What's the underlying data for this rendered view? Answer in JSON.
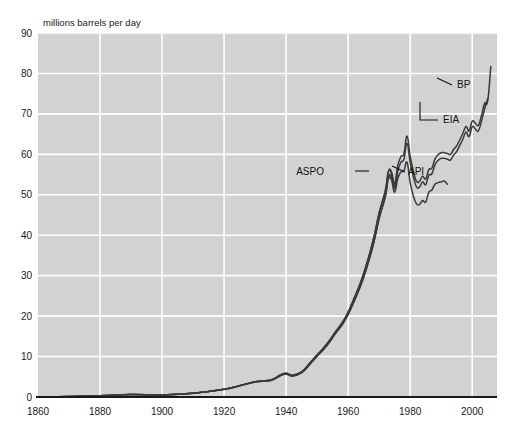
{
  "chart_data": {
    "type": "line",
    "title": "",
    "ylabel": "millions barrels per day",
    "xlabel": "",
    "xlim": [
      1860,
      2008
    ],
    "ylim": [
      0,
      90
    ],
    "grid": true,
    "legend_position": "inline-right-annotations",
    "xticks": [
      1860,
      1880,
      1900,
      1920,
      1940,
      1960,
      1980,
      2000
    ],
    "yticks": [
      0,
      10,
      20,
      30,
      40,
      50,
      60,
      70,
      80,
      90
    ],
    "xtick_labels": [
      "1860",
      "1880",
      "1900",
      "1920",
      "1940",
      "1960",
      "1980",
      "2000"
    ],
    "ytick_labels": [
      "0",
      "10",
      "20",
      "30",
      "40",
      "50",
      "60",
      "70",
      "80",
      "90"
    ],
    "background_color": "#d2d2d2",
    "gridline_color": "#ffffff",
    "line_color": "#3a3a3a",
    "axis_color": "#1a1a1a",
    "series": [
      {
        "name": "BP",
        "label": "BP",
        "x": [
          1860,
          1870,
          1880,
          1890,
          1900,
          1910,
          1920,
          1925,
          1930,
          1935,
          1938,
          1940,
          1942,
          1945,
          1948,
          1950,
          1953,
          1956,
          1959,
          1962,
          1965,
          1968,
          1970,
          1972,
          1973,
          1974,
          1975,
          1976,
          1977,
          1978,
          1979,
          1980,
          1981,
          1982,
          1983,
          1984,
          1985,
          1986,
          1987,
          1988,
          1989,
          1990,
          1991,
          1992,
          1993,
          1994,
          1995,
          1996,
          1997,
          1998,
          1999,
          2000,
          2001,
          2002,
          2003,
          2004,
          2005,
          2006
        ],
        "values": [
          0.01,
          0.1,
          0.3,
          0.6,
          0.5,
          0.9,
          1.9,
          2.8,
          3.8,
          4.2,
          5.4,
          5.9,
          5.4,
          6.2,
          8.7,
          10.4,
          13.0,
          16.2,
          19.5,
          24.5,
          30.5,
          38.5,
          45.5,
          51.0,
          55.8,
          55.6,
          52.8,
          57.2,
          59.4,
          60.2,
          64.5,
          59.5,
          56.0,
          53.4,
          53.3,
          54.6,
          53.9,
          56.2,
          56.6,
          58.8,
          59.9,
          60.4,
          60.4,
          60.2,
          60.0,
          61.2,
          62.1,
          63.6,
          65.2,
          66.9,
          65.8,
          68.2,
          67.7,
          67.2,
          69.6,
          72.6,
          73.2,
          81.7
        ]
      },
      {
        "name": "EIA",
        "label": "EIA",
        "x": [
          1860,
          1870,
          1880,
          1890,
          1900,
          1910,
          1920,
          1925,
          1930,
          1935,
          1938,
          1940,
          1942,
          1945,
          1948,
          1950,
          1953,
          1956,
          1959,
          1962,
          1965,
          1968,
          1970,
          1972,
          1973,
          1974,
          1975,
          1976,
          1977,
          1978,
          1979,
          1980,
          1981,
          1982,
          1983,
          1984,
          1985,
          1986,
          1987,
          1988,
          1989,
          1990,
          1991,
          1992,
          1993,
          1994,
          1995,
          1996,
          1997,
          1998,
          1999,
          2000,
          2001,
          2002,
          2003,
          2004,
          2005
        ],
        "values": [
          0.01,
          0.1,
          0.3,
          0.6,
          0.5,
          0.9,
          1.9,
          2.8,
          3.7,
          4.1,
          5.2,
          5.7,
          5.2,
          6.0,
          8.4,
          10.1,
          12.6,
          15.8,
          19.0,
          23.8,
          29.6,
          37.4,
          44.2,
          49.6,
          54.5,
          54.3,
          51.5,
          55.8,
          58.0,
          58.8,
          62.7,
          58.0,
          54.6,
          52.0,
          51.9,
          53.2,
          52.5,
          54.8,
          55.2,
          57.4,
          58.5,
          59.0,
          59.0,
          58.8,
          58.6,
          59.8,
          60.7,
          62.2,
          63.8,
          65.5,
          64.4,
          66.8,
          66.3,
          65.8,
          68.2,
          71.2,
          73.8
        ]
      },
      {
        "name": "API",
        "label": "API",
        "x": [
          1860,
          1870,
          1880,
          1890,
          1900,
          1910,
          1920,
          1925,
          1930,
          1935,
          1938,
          1940,
          1942,
          1945,
          1948,
          1950,
          1953,
          1956,
          1959,
          1962,
          1965,
          1968,
          1970,
          1972,
          1973,
          1974,
          1975,
          1976,
          1977,
          1978,
          1979,
          1980,
          1981,
          1982,
          1983,
          1984,
          1985,
          1986,
          1987,
          1988,
          1989,
          1990,
          1991,
          1992
        ],
        "values": [
          0.01,
          0.1,
          0.3,
          0.6,
          0.5,
          0.9,
          1.9,
          2.8,
          3.7,
          4.1,
          5.2,
          5.7,
          5.2,
          6.0,
          8.4,
          10.1,
          12.6,
          15.8,
          19.0,
          23.8,
          29.6,
          37.4,
          44.2,
          49.6,
          54.0,
          53.6,
          50.6,
          54.0,
          55.6,
          56.0,
          58.0,
          53.0,
          49.8,
          47.8,
          47.6,
          48.6,
          48.2,
          50.6,
          51.2,
          52.6,
          53.0,
          53.2,
          53.4,
          52.6
        ]
      },
      {
        "name": "ASPO",
        "label": "ASPO",
        "x": [
          1860,
          1870,
          1880,
          1890,
          1900,
          1910,
          1920,
          1925,
          1930,
          1935,
          1938,
          1940,
          1942,
          1945,
          1948,
          1950,
          1953,
          1956,
          1959,
          1962,
          1965,
          1968,
          1970,
          1972,
          1973,
          1974,
          1975,
          1976
        ],
        "values": [
          0.01,
          0.1,
          0.3,
          0.6,
          0.5,
          0.9,
          1.9,
          2.8,
          3.8,
          4.2,
          5.4,
          5.9,
          5.4,
          6.2,
          8.7,
          10.4,
          13.0,
          16.2,
          19.5,
          24.5,
          30.5,
          38.5,
          45.5,
          51.0,
          55.8,
          55.2,
          52.2,
          56.6
        ]
      }
    ],
    "annotations": [
      {
        "name": "BP",
        "text": "BP",
        "label_x": 457,
        "label_y": 88,
        "leader_from_x": 452,
        "leader_from_y": 85,
        "leader_to_x": 437,
        "leader_to_y": 78
      },
      {
        "name": "EIA",
        "text": "EIA",
        "label_x": 443,
        "label_y": 123,
        "leader_from_x": 438,
        "leader_from_y": 120,
        "leader_to_x": 420,
        "leader_to_y": 120,
        "elbow_x": 420,
        "elbow_y": 102
      },
      {
        "name": "API",
        "text": "API",
        "label_x": 408,
        "label_y": 175,
        "leader_from_x": 405,
        "leader_from_y": 172,
        "leader_to_x": 392,
        "leader_to_y": 166
      },
      {
        "name": "ASPO",
        "text": "ASPO",
        "label_x": 324,
        "label_y": 175,
        "leader_from_x": 355,
        "leader_from_y": 171,
        "leader_to_x": 369,
        "leader_to_y": 171
      }
    ]
  },
  "plot": {
    "left": 38,
    "top": 33,
    "right": 497,
    "bottom": 397
  }
}
